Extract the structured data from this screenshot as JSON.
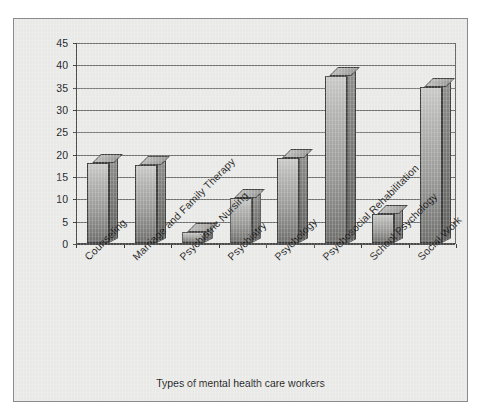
{
  "chart_data": {
    "type": "bar",
    "title": "",
    "xlabel": "Types of mental health care workers",
    "ylabel": "Rates per 100,000 population",
    "categories": [
      "Counseling",
      "Marriage and Family Therapy",
      "Psychiatric Nursing",
      "Psychiatry",
      "Psychology",
      "Psychosocial Rehabilitation",
      "School Psychology",
      "Social Work"
    ],
    "values": [
      18,
      17.5,
      2.5,
      10,
      19,
      37.5,
      6.5,
      35
    ],
    "ylim": [
      0,
      45
    ],
    "yticks": [
      0,
      5,
      10,
      15,
      20,
      25,
      30,
      35,
      40,
      45
    ],
    "ytick_labels": [
      "0",
      "5",
      "10",
      "15",
      "20",
      "25",
      "30",
      "35",
      "40",
      "45"
    ],
    "grid": true,
    "legend": "none",
    "style": "3d-column",
    "colors": {
      "bar_face_light": "#c9c9c7",
      "bar_face_dark": "#6e6e6c",
      "bar_side": "#7a7a78",
      "bar_outline": "#3f3f3f",
      "plot_background": "#e9e9e7",
      "axis": "#3a3a3a",
      "gridline": "#6f6f6f",
      "text": "#1c1c1c",
      "frame_border": "#8a8a8a",
      "page_background": "#ffffff"
    }
  }
}
